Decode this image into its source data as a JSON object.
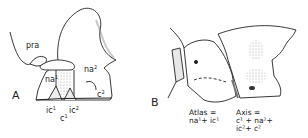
{
  "figure": {
    "panels": [
      {
        "letter": "A",
        "labels": {
          "pra": "pra",
          "na1": "na",
          "na1_sup": "1",
          "na2": "na",
          "na2_sup": "2",
          "c2": "c",
          "c2_sup": "2",
          "ic1": "ic",
          "ic1_sup": "1",
          "ic2": "ic",
          "ic2_sup": "2",
          "c1": "c",
          "c1_sup": "1"
        }
      },
      {
        "letter": "B",
        "captions": {
          "atlas_line1": "Atlas =",
          "atlas_line2": "na¹+ ic¹",
          "axis_line1": "Axis =",
          "axis_line2": "c¹ + na²+",
          "axis_line3": "ic²+ c²"
        }
      }
    ],
    "colors": {
      "ink": "#222222",
      "shade": "#9a9a9a",
      "background": "#ffffff"
    }
  }
}
